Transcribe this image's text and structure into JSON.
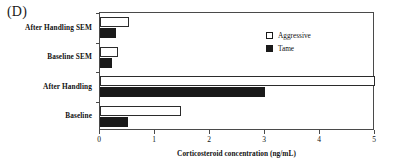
{
  "panel": {
    "label": "(D)"
  },
  "legend": {
    "position": "inside-top-right",
    "entries": [
      {
        "label": "Aggressive",
        "swatch": "white-square-outline",
        "color": "#ffffff"
      },
      {
        "label": "Tame",
        "swatch": "black-square-filled",
        "color": "#1a1a1a"
      }
    ]
  },
  "chart_data": {
    "type": "bar",
    "orientation": "horizontal",
    "title": "",
    "xlabel": "Corticosteroid concentration (ng/mL)",
    "ylabel": "",
    "xlim": [
      0,
      5
    ],
    "xticks": [
      0,
      1,
      2,
      3,
      4,
      5
    ],
    "xticklabels": [
      "0",
      "1",
      "2",
      "3",
      "4",
      "5"
    ],
    "grid": false,
    "categories": [
      "Baseline",
      "After Handling",
      "Baseline SEM",
      "After Handling SEM"
    ],
    "series": [
      {
        "name": "Aggressive",
        "color": "#ffffff",
        "edgecolor": "#2b2b2b",
        "values": [
          1.48,
          5.0,
          0.33,
          0.53
        ]
      },
      {
        "name": "Tame",
        "color": "#1a1a1a",
        "edgecolor": "#1a1a1a",
        "values": [
          0.5,
          3.0,
          0.21,
          0.29
        ]
      }
    ]
  }
}
